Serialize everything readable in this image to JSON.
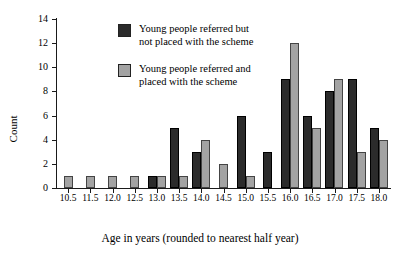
{
  "chart_data": {
    "type": "bar",
    "title": "",
    "xlabel": "Age in years (rounded to nearest half year)",
    "ylabel": "Count",
    "ylim": [
      0,
      14
    ],
    "yticks": [
      0,
      2,
      4,
      6,
      8,
      10,
      12,
      14
    ],
    "ytick_labels": [
      "0",
      "2",
      "4",
      "6",
      "8",
      "10",
      "12",
      "14"
    ],
    "grid": false,
    "legend_position": "upper-left-inside",
    "categories": [
      "10.5",
      "11.5",
      "12.0",
      "12.5",
      "13.0",
      "13.5",
      "14.0",
      "14.5",
      "15.0",
      "15.5",
      "16.0",
      "16.5",
      "17.0",
      "17.5",
      "18.0"
    ],
    "series": [
      {
        "name": "Young people referred but not placed with the scheme",
        "color": "#2b2b2b",
        "values": [
          0,
          0,
          0,
          0,
          1,
          5,
          3,
          0,
          6,
          3,
          9,
          6,
          8,
          9,
          5
        ]
      },
      {
        "name": "Young people referred and placed with the scheme",
        "color": "#a3a3a3",
        "values": [
          1,
          1,
          1,
          1,
          1,
          1,
          4,
          2,
          1,
          0,
          12,
          5,
          9,
          3,
          4
        ]
      }
    ]
  },
  "legend": {
    "items": [
      {
        "swatch": "dark-square-swatch",
        "line1": "Young people referred but",
        "line2": "not placed with the scheme"
      },
      {
        "swatch": "gray-square-swatch",
        "line1": "Young people referred and",
        "line2": "placed with the scheme"
      }
    ]
  }
}
